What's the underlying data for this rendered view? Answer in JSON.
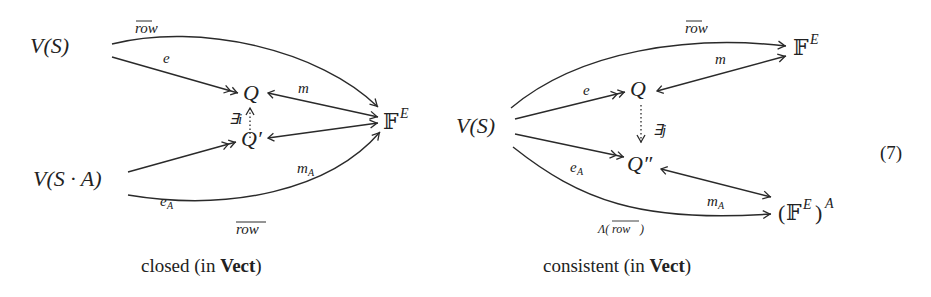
{
  "equation_number": "(7)",
  "diagrams": [
    {
      "caption_prefix": "closed (in ",
      "caption_bold": "Vect",
      "caption_suffix": ")",
      "nodes": {
        "vs": "V(S)",
        "q": "Q",
        "q_prime": "Q′",
        "vsa": "V(S · A)",
        "fe_base": "𝔽",
        "fe_sup": "E"
      },
      "labels": {
        "row_top": "row",
        "e": "e",
        "m": "m",
        "exists_i": "∃i",
        "m_a_base": "m",
        "m_a_sub": "A",
        "e_a_base": "e",
        "e_a_sub": "A",
        "row_bottom": "row"
      }
    },
    {
      "caption_prefix": "consistent (in ",
      "caption_bold": "Vect",
      "caption_suffix": ")",
      "nodes": {
        "vs": "V(S)",
        "q": "Q",
        "q_dprime": "Q″",
        "fe_base": "𝔽",
        "fe_sup": "E",
        "fea_open": "(",
        "fea_base": "𝔽",
        "fea_sup1": "E",
        "fea_close": ")",
        "fea_sup2": "A"
      },
      "labels": {
        "row_top": "row",
        "m": "m",
        "e": "e",
        "exists_j": "∃j",
        "e_a_base": "e",
        "e_a_sub": "A",
        "m_a_base": "m",
        "m_a_sub": "A",
        "lambda_row_prefix": "Λ(",
        "lambda_row_inner": "row",
        "lambda_row_suffix": ")"
      }
    }
  ]
}
